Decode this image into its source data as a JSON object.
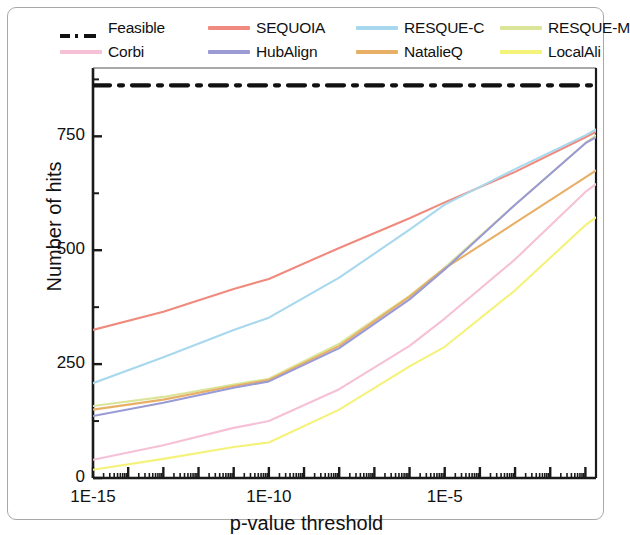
{
  "figure": {
    "xlabel": "p-value threshold",
    "ylabel": "Number of hits"
  },
  "legend": {
    "items": [
      {
        "label": "Feasible",
        "color": "#111111",
        "style": "dashdot",
        "row": 0,
        "col": 0
      },
      {
        "label": "SEQUOIA",
        "color": "#f08a7e",
        "style": "solid",
        "row": 0,
        "col": 1
      },
      {
        "label": "RESQUE-C",
        "color": "#a8d8ee",
        "style": "solid",
        "row": 0,
        "col": 2
      },
      {
        "label": "RESQUE-M",
        "color": "#dbe59a",
        "style": "solid",
        "row": 0,
        "col": 3
      },
      {
        "label": "Corbi",
        "color": "#f6c0d6",
        "style": "solid",
        "row": 1,
        "col": 0
      },
      {
        "label": "HubAlign",
        "color": "#9a9ad4",
        "style": "solid",
        "row": 1,
        "col": 1
      },
      {
        "label": "NatalieQ",
        "color": "#e8b066",
        "style": "solid",
        "row": 1,
        "col": 2
      },
      {
        "label": "LocalAli",
        "color": "#f5f27a",
        "style": "solid",
        "row": 1,
        "col": 3
      }
    ]
  },
  "chart_data": {
    "type": "line",
    "title": "",
    "xlabel": "p-value threshold",
    "ylabel": "Number of hits",
    "xscale": "log",
    "xlim": [
      1e-15,
      0.2
    ],
    "ylim": [
      0,
      900
    ],
    "yticks": [
      0,
      250,
      500,
      750
    ],
    "ytick_labels": [
      "0",
      "250",
      "500",
      "750"
    ],
    "xticks": [
      1e-15,
      1e-10,
      1e-05
    ],
    "xtick_labels": [
      "1E-15",
      "1E-10",
      "1E-5"
    ],
    "grid": false,
    "legend_position": "above-plot",
    "series": [
      {
        "name": "Feasible",
        "color": "#111111",
        "style": "dashdot",
        "x": [
          1e-15,
          0.2
        ],
        "y": [
          862,
          862
        ]
      },
      {
        "name": "SEQUOIA",
        "color": "#f08a7e",
        "style": "solid",
        "x": [
          1e-15,
          1e-13,
          1e-11,
          1e-10,
          1e-08,
          1e-06,
          1e-05,
          0.001,
          0.1,
          0.2
        ],
        "y": [
          325,
          365,
          415,
          437,
          505,
          570,
          605,
          672,
          748,
          760
        ]
      },
      {
        "name": "RESQUE-C",
        "color": "#a8d8ee",
        "style": "solid",
        "x": [
          1e-15,
          1e-13,
          1e-11,
          1e-10,
          1e-08,
          1e-06,
          1e-05,
          0.001,
          0.1,
          0.2
        ],
        "y": [
          208,
          265,
          325,
          352,
          440,
          545,
          600,
          678,
          752,
          765
        ]
      },
      {
        "name": "RESQUE-M",
        "color": "#dbe59a",
        "style": "solid",
        "x": [
          1e-15,
          1e-13,
          1e-11,
          1e-10,
          1e-08,
          1e-06,
          1e-05,
          0.001,
          0.1,
          0.2
        ],
        "y": [
          158,
          178,
          205,
          218,
          295,
          400,
          462,
          600,
          735,
          752
        ]
      },
      {
        "name": "HubAlign",
        "color": "#9a9ad4",
        "style": "solid",
        "x": [
          1e-15,
          1e-13,
          1e-11,
          1e-10,
          1e-08,
          1e-06,
          1e-05,
          0.001,
          0.1,
          0.2
        ],
        "y": [
          136,
          165,
          198,
          212,
          285,
          392,
          458,
          600,
          735,
          748
        ]
      },
      {
        "name": "NatalieQ",
        "color": "#e8b066",
        "style": "solid",
        "x": [
          1e-15,
          1e-13,
          1e-11,
          1e-10,
          1e-08,
          1e-06,
          1e-05,
          0.001,
          0.1,
          0.2
        ],
        "y": [
          150,
          172,
          202,
          215,
          290,
          398,
          460,
          560,
          660,
          675
        ]
      },
      {
        "name": "Corbi",
        "color": "#f6c0d6",
        "style": "solid",
        "x": [
          1e-15,
          1e-13,
          1e-11,
          1e-10,
          1e-08,
          1e-06,
          1e-05,
          0.001,
          0.1,
          0.2
        ],
        "y": [
          40,
          72,
          110,
          125,
          195,
          290,
          350,
          480,
          628,
          645
        ]
      },
      {
        "name": "LocalAli",
        "color": "#f5f27a",
        "style": "solid",
        "x": [
          1e-15,
          1e-13,
          1e-11,
          1e-10,
          1e-08,
          1e-06,
          1e-05,
          0.001,
          0.1,
          0.2
        ],
        "y": [
          18,
          42,
          68,
          78,
          150,
          245,
          288,
          412,
          555,
          572
        ]
      }
    ]
  }
}
